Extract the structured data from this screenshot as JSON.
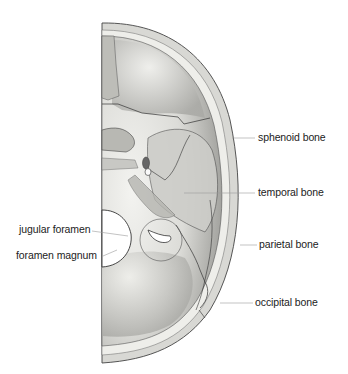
{
  "diagram": {
    "labels": {
      "sphenoid": "sphenoid bone",
      "temporal": "temporal bone",
      "parietal": "parietal bone",
      "occipital": "occipital bone",
      "jugular": "jugular foramen",
      "magnum": "foramen magnum"
    },
    "colors": {
      "bone_light": "#f1f1ee",
      "bone_mid": "#cfcfcb",
      "bone_dark": "#8e8e8a",
      "outline": "#444444",
      "leader_line": "#9a9a9a",
      "text": "#222222"
    }
  }
}
